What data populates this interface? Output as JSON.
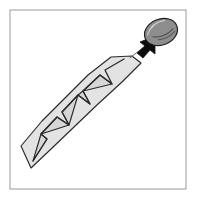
{
  "figure": {
    "background_color": "#ffffff",
    "frame": {
      "label": "figure-border",
      "x": 10,
      "y": 10,
      "width": 176,
      "height": 179,
      "stroke_color": "#9a9a9a",
      "stroke_width": 1,
      "fill": "none"
    },
    "shank": {
      "label": "twisted shank",
      "description": "Elongated tapered band running from lower-left point to upper-right end, faceted by zigzag fold lines",
      "fill_color": "#e3e3e3",
      "outline_color": "#2a2a2a",
      "outline_width": 1.15,
      "outline_points": "31,168 21,146 42,121 65,98 88,75 111,57 132,56 141,63 122,82 98,104 74,127 50,150",
      "facet_fill": "#d6d6d6",
      "tip_point": "31,168",
      "top_end": "141,63",
      "zigzag_path": "M 33,161 L 47,139 L 41,134 L 57,117 L 69,125 L 62,112 L 78,95 L 90,104 L 83,91 L 100,75 L 112,84 L 105,70 L 124,59",
      "fold_segments": [
        {
          "name": "fold-1",
          "from": "33,161",
          "to": "47,139"
        },
        {
          "name": "fold-2",
          "from": "47,139",
          "to": "41,134"
        },
        {
          "name": "fold-3",
          "from": "41,134",
          "to": "57,117"
        },
        {
          "name": "fold-4",
          "from": "57,117",
          "to": "69,125"
        },
        {
          "name": "fold-5",
          "from": "69,125",
          "to": "62,112"
        },
        {
          "name": "fold-6",
          "from": "62,112",
          "to": "78,95"
        },
        {
          "name": "fold-7",
          "from": "78,95",
          "to": "90,104"
        },
        {
          "name": "fold-8",
          "from": "90,104",
          "to": "83,91"
        },
        {
          "name": "fold-9",
          "from": "83,91",
          "to": "100,75"
        },
        {
          "name": "fold-10",
          "from": "100,75",
          "to": "112,84"
        },
        {
          "name": "fold-11",
          "from": "112,84",
          "to": "105,70"
        },
        {
          "name": "fold-12",
          "from": "105,70",
          "to": "124,59"
        }
      ]
    },
    "head": {
      "label": "fastener head",
      "description": "Detached oval cap shown separated above and right of the shank",
      "center_x": 161,
      "center_y": 32,
      "radius_x": 17,
      "radius_y": 13,
      "rotation_deg": -22,
      "fill_color": "#8d8d8d",
      "outline_color": "#1f1f1f",
      "outline_width": 1.2,
      "highlight_color": "#cfcfcf",
      "seam_color": "#4a4a4a"
    },
    "arrow": {
      "label": "assembly direction arrow",
      "description": "Thin leader line from the shank end up to the head, terminating in a solid filled arrowhead",
      "tail_from_x": 130,
      "tail_from_y": 58,
      "tail_to_x": 150,
      "tail_to_y": 42,
      "tail_color": "#6f6f6f",
      "head_fill": "#0d0d0d",
      "head_points": "155,36 140,42 145,46 137,53 143,58 150,50 155,54",
      "direction": "lower-left to upper-right"
    }
  }
}
